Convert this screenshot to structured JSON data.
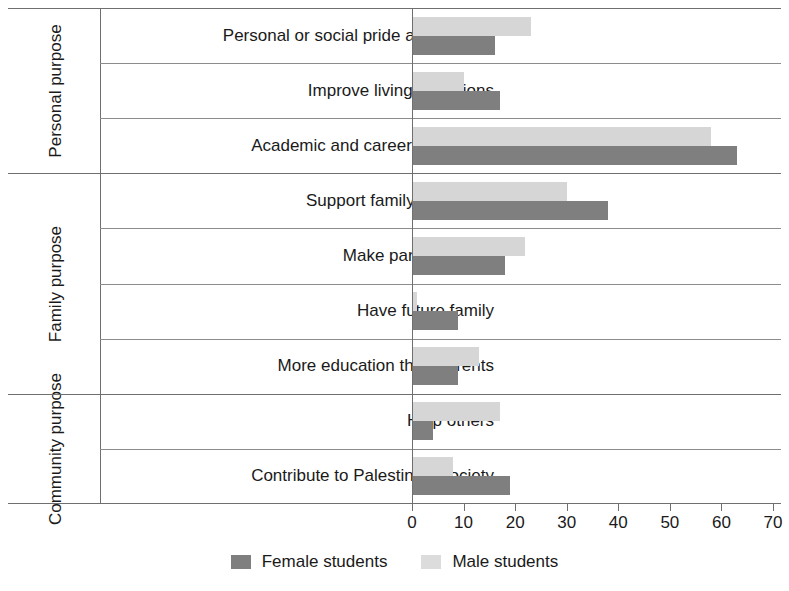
{
  "chart_data": {
    "type": "bar",
    "orientation": "horizontal",
    "title": "",
    "xlabel": "",
    "ylabel": "",
    "xlim": [
      0,
      70
    ],
    "xticks": [
      0,
      10,
      20,
      30,
      40,
      50,
      60,
      70
    ],
    "grid": false,
    "legend_position": "bottom",
    "series": [
      {
        "name": "Female students",
        "color": "#7f7f7f",
        "values": [
          16,
          17,
          63,
          38,
          18,
          9,
          9,
          4,
          19
        ]
      },
      {
        "name": "Male students",
        "color": "#d6d6d6",
        "values": [
          23,
          10,
          58,
          30,
          22,
          1,
          13,
          17,
          8
        ]
      }
    ],
    "categories": [
      "Personal or social pride and respect",
      "Improve living conditions",
      "Academic and career motivation",
      "Support family financially",
      "Make parents proud",
      "Have future family",
      "More education than parents",
      "Help others",
      "Contribute to Palestinian society"
    ],
    "groups": [
      {
        "label": "Personal purpose",
        "categories": [
          "Personal or social pride and respect",
          "Improve living conditions",
          "Academic and career motivation"
        ]
      },
      {
        "label": "Family purpose",
        "categories": [
          "Support family financially",
          "Make parents proud",
          "Have future family",
          "More education than parents"
        ]
      },
      {
        "label": "Community purpose",
        "categories": [
          "Help others",
          "Contribute to Palestinian society"
        ]
      }
    ]
  },
  "legend": {
    "items": [
      {
        "label": "Female students",
        "swatch": "female"
      },
      {
        "label": "Male students",
        "swatch": "male"
      }
    ]
  },
  "axis": {
    "ticks": [
      "0",
      "10",
      "20",
      "30",
      "40",
      "50",
      "60",
      "70"
    ]
  }
}
